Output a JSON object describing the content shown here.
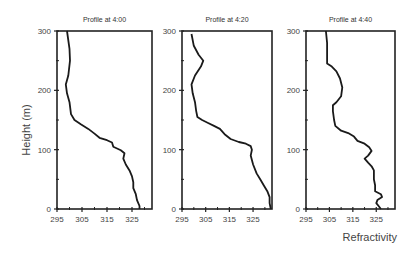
{
  "chart_data": {
    "type": "line",
    "ylabel": "Height (m)",
    "xlabel": "Refractivity",
    "shared_axes": {
      "xlim": [
        295,
        333
      ],
      "ylim": [
        0,
        300
      ],
      "xticks": [
        295,
        305,
        315,
        325
      ],
      "yticks": [
        0,
        100,
        200,
        300
      ],
      "grid": false
    },
    "panels": [
      {
        "title": "Profile at 4:00",
        "series": [
          {
            "name": "Profile at 4:00",
            "points": [
              [
                299,
                300
              ],
              [
                300,
                270
              ],
              [
                300.2,
                250
              ],
              [
                299.5,
                225
              ],
              [
                298.5,
                210
              ],
              [
                299,
                195
              ],
              [
                300,
                180
              ],
              [
                300.6,
                160
              ],
              [
                302,
                150
              ],
              [
                304.5,
                143
              ],
              [
                307.5,
                135
              ],
              [
                310,
                127
              ],
              [
                312,
                120
              ],
              [
                315,
                116
              ],
              [
                317,
                112
              ],
              [
                317.5,
                105
              ],
              [
                320.5,
                99
              ],
              [
                322,
                94
              ],
              [
                321.5,
                85
              ],
              [
                322.5,
                75
              ],
              [
                324,
                65
              ],
              [
                325,
                55
              ],
              [
                325.5,
                45
              ],
              [
                325.5,
                35
              ],
              [
                326.5,
                25
              ],
              [
                327,
                15
              ],
              [
                328,
                5
              ],
              [
                328,
                0
              ]
            ]
          }
        ]
      },
      {
        "title": "Profile at 4:20",
        "series": [
          {
            "name": "Profile at 4:20",
            "points": [
              [
                299,
                295
              ],
              [
                300,
                275
              ],
              [
                302,
                260
              ],
              [
                304,
                250
              ],
              [
                303,
                240
              ],
              [
                300.5,
                225
              ],
              [
                299,
                210
              ],
              [
                299.5,
                195
              ],
              [
                300.5,
                180
              ],
              [
                301,
                165
              ],
              [
                301.5,
                155
              ],
              [
                303.5,
                150
              ],
              [
                306,
                145
              ],
              [
                308.5,
                140
              ],
              [
                311,
                135
              ],
              [
                313,
                126
              ],
              [
                315.5,
                118
              ],
              [
                319,
                113
              ],
              [
                322,
                110
              ],
              [
                324,
                106
              ],
              [
                324.5,
                100
              ],
              [
                324,
                90
              ],
              [
                325,
                75
              ],
              [
                326.5,
                60
              ],
              [
                328,
                50
              ],
              [
                329.5,
                40
              ],
              [
                331,
                30
              ],
              [
                332,
                20
              ],
              [
                332,
                10
              ],
              [
                332.5,
                0
              ]
            ]
          }
        ]
      },
      {
        "title": "Profile at 4:40",
        "series": [
          {
            "name": "Profile at 4:40",
            "points": [
              [
                303.5,
                300
              ],
              [
                304,
                280
              ],
              [
                304,
                260
              ],
              [
                304,
                245
              ],
              [
                306,
                240
              ],
              [
                308,
                232
              ],
              [
                309.5,
                220
              ],
              [
                310.5,
                205
              ],
              [
                310,
                190
              ],
              [
                308,
                180
              ],
              [
                306.5,
                175
              ],
              [
                306.5,
                165
              ],
              [
                307,
                150
              ],
              [
                307.5,
                140
              ],
              [
                310,
                132
              ],
              [
                313,
                128
              ],
              [
                315.5,
                122
              ],
              [
                317,
                115
              ],
              [
                320,
                110
              ],
              [
                322,
                104
              ],
              [
                323,
                98
              ],
              [
                321.5,
                90
              ],
              [
                320,
                85
              ],
              [
                321.5,
                78
              ],
              [
                323,
                72
              ],
              [
                324,
                65
              ],
              [
                324,
                50
              ],
              [
                324.5,
                40
              ],
              [
                324.5,
                30
              ],
              [
                327,
                25
              ],
              [
                327.5,
                20
              ],
              [
                325.5,
                15
              ],
              [
                325,
                10
              ],
              [
                326,
                5
              ],
              [
                327,
                0
              ]
            ]
          }
        ]
      }
    ]
  }
}
